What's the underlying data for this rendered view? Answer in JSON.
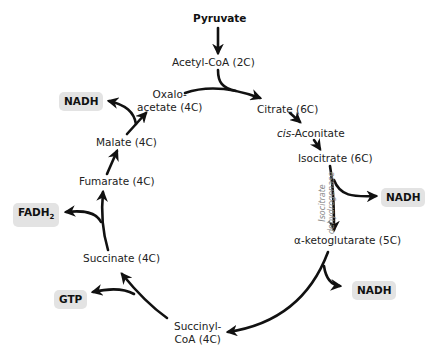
{
  "diagram": {
    "input": "Pyruvate",
    "metabolites": {
      "acetyl_coa": "Acetyl-CoA (2C)",
      "citrate": "Citrate (6C)",
      "cis_aconitate_prefix": "cis",
      "cis_aconitate_suffix": "-Aconitate",
      "isocitrate": "Isocitrate (6C)",
      "alpha_ketoglutarate": "α-ketoglutarate (5C)",
      "succinyl_coa_line1": "Succinyl-",
      "succinyl_coa_line2": "CoA (4C)",
      "succinate": "Succinate (4C)",
      "fumarate": "Fumarate (4C)",
      "malate": "Malate (4C)",
      "oxaloacetate_line1": "Oxalo-",
      "oxaloacetate_line2": "acetate (4C)"
    },
    "enzyme": {
      "line1": "Isocitrate",
      "line2": "dehydrogenase"
    },
    "products": {
      "nadh_isocitrate": "NADH",
      "nadh_ketoglutarate": "NADH",
      "gtp": "GTP",
      "fadh2_base": "FADH",
      "fadh2_sub": "2",
      "nadh_malate": "NADH"
    },
    "colors": {
      "arrow": "#111111",
      "badge_bg": "#e3e3e3",
      "enzyme_text": "#888888"
    }
  }
}
